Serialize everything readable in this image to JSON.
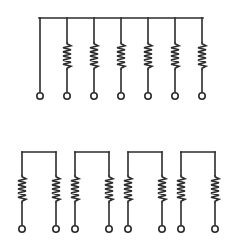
{
  "figure": {
    "background_color": "#ffffff",
    "line_color": "#2b2b2b",
    "terminal_fill": "#ffffff",
    "line_width": 1.6,
    "terminal_radius": 3.2,
    "canvas": {
      "width": 230,
      "height": 246
    }
  },
  "networks": [
    {
      "id": "bussed-network",
      "name": "Bussed resistor network",
      "label": "",
      "bus": {
        "y": 18,
        "x_start": 39,
        "x_end": 203
      },
      "pin_count": 7,
      "resistor_count": 6,
      "common_pin_index": 0,
      "pin_x": [
        40,
        67,
        94,
        121,
        148,
        175,
        202
      ],
      "terminal_y": 96,
      "resistor_top_y": 42,
      "resistor_bottom_y": 70,
      "zig_amplitude": 4.0,
      "zig_peaks": 6,
      "pins": [
        {
          "index": 1,
          "x": 40,
          "has_resistor": false
        },
        {
          "index": 2,
          "x": 67,
          "has_resistor": true
        },
        {
          "index": 3,
          "x": 94,
          "has_resistor": true
        },
        {
          "index": 4,
          "x": 121,
          "has_resistor": true
        },
        {
          "index": 5,
          "x": 148,
          "has_resistor": true
        },
        {
          "index": 6,
          "x": 175,
          "has_resistor": true
        },
        {
          "index": 7,
          "x": 202,
          "has_resistor": true
        }
      ]
    },
    {
      "id": "isolated-network",
      "name": "Isolated resistor network",
      "label": "",
      "group_count": 4,
      "resistor_count": 8,
      "pin_count": 8,
      "bridge_y": 152,
      "terminal_y": 229,
      "resistor_top_y": 175,
      "resistor_bottom_y": 203,
      "zig_amplitude": 4.0,
      "zig_peaks": 6,
      "groups": [
        {
          "index": 1,
          "left_x": 22,
          "right_x": 56
        },
        {
          "index": 2,
          "left_x": 75,
          "right_x": 109
        },
        {
          "index": 3,
          "left_x": 128,
          "right_x": 162
        },
        {
          "index": 4,
          "left_x": 181,
          "right_x": 215
        }
      ]
    }
  ]
}
